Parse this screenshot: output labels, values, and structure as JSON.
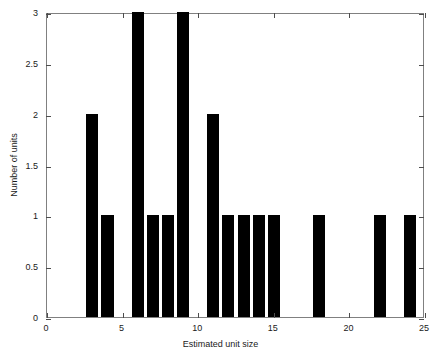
{
  "chart_data": {
    "type": "bar",
    "title": "",
    "subtitle": "",
    "xlabel": "Estimated unit size",
    "ylabel": "Number of units",
    "xlim": [
      0,
      25
    ],
    "ylim": [
      0,
      3
    ],
    "xticks": [
      0,
      5,
      10,
      15,
      20,
      25
    ],
    "xticklabels": [
      "0",
      "5",
      "10",
      "15",
      "20",
      "25"
    ],
    "yticks": [
      0,
      0.5,
      1,
      1.5,
      2,
      2.5,
      3
    ],
    "yticklabels": [
      "0",
      "0.5",
      "1",
      "1.5",
      "2",
      "2.5",
      "3"
    ],
    "grid": false,
    "legend": null,
    "bar_color": "#000000",
    "bin_width": 0.8,
    "categories": [
      3,
      4,
      6,
      7,
      8,
      9,
      11,
      12,
      13,
      14,
      15,
      18,
      22,
      24
    ],
    "values": [
      2,
      1,
      3,
      1,
      1,
      3,
      2,
      1,
      1,
      1,
      1,
      1,
      1,
      1
    ],
    "bars": [
      {
        "x": 3,
        "y": 2,
        "label": "bar-x3-y2"
      },
      {
        "x": 4,
        "y": 1,
        "label": "bar-x4-y1"
      },
      {
        "x": 6,
        "y": 3,
        "label": "bar-x6-y3"
      },
      {
        "x": 7,
        "y": 1,
        "label": "bar-x7-y1"
      },
      {
        "x": 8,
        "y": 1,
        "label": "bar-x8-y1"
      },
      {
        "x": 9,
        "y": 3,
        "label": "bar-x9-y3"
      },
      {
        "x": 11,
        "y": 2,
        "label": "bar-x11-y2"
      },
      {
        "x": 12,
        "y": 1,
        "label": "bar-x12-y1"
      },
      {
        "x": 13,
        "y": 1,
        "label": "bar-x13-y1"
      },
      {
        "x": 14,
        "y": 1,
        "label": "bar-x14-y1"
      },
      {
        "x": 15,
        "y": 1,
        "label": "bar-x15-y1"
      },
      {
        "x": 18,
        "y": 1,
        "label": "bar-x18-y1"
      },
      {
        "x": 22,
        "y": 1,
        "label": "bar-x22-y1"
      },
      {
        "x": 24,
        "y": 1,
        "label": "bar-x24-y1"
      }
    ]
  }
}
